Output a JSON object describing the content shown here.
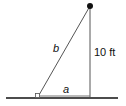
{
  "diagram": {
    "type": "right-triangle",
    "labels": {
      "hypotenuse": "b",
      "base": "a",
      "height": "10 ft"
    },
    "colors": {
      "line": "#555555",
      "ground": "#111111",
      "point": "#111111"
    }
  }
}
